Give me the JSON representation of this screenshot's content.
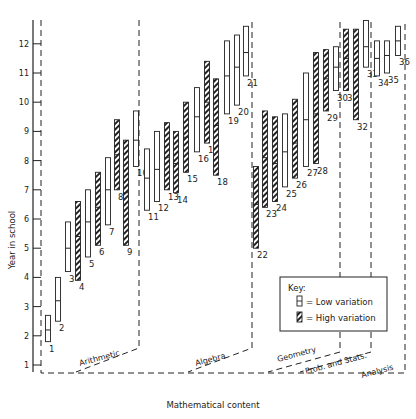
{
  "chart_data": {
    "type": "range-bar",
    "title": "",
    "xlabel": "Mathematical content",
    "ylabel": "Year in school",
    "ylim": [
      1,
      12.7
    ],
    "yticks": [
      1,
      2,
      3,
      4,
      5,
      6,
      7,
      8,
      9,
      10,
      11,
      12
    ],
    "grid": false,
    "regions": [
      {
        "name": "Arithmetic",
        "items": [
          1,
          2,
          3,
          4,
          5,
          6,
          7,
          8,
          9,
          10
        ]
      },
      {
        "name": "Algebra",
        "items": [
          11,
          12,
          13,
          14,
          15,
          16,
          17,
          18,
          19,
          20,
          21
        ]
      },
      {
        "name": "Geometry",
        "items": [
          22,
          23,
          24,
          25,
          26,
          27,
          28,
          29,
          30
        ]
      },
      {
        "name": "Prob. and Stats.",
        "items": [
          31,
          32,
          33
        ]
      },
      {
        "name": "Analysis",
        "items": [
          34,
          35,
          36
        ]
      }
    ],
    "legend": {
      "title": "Key:",
      "entries": [
        {
          "label": "= Low variation",
          "style": "open"
        },
        {
          "label": "= High variation",
          "style": "hatched"
        }
      ],
      "position": "lower right"
    },
    "series": [
      {
        "id": 1,
        "x": 48,
        "low": 1.8,
        "median": 2.2,
        "high": 2.7,
        "variation": "low"
      },
      {
        "id": 2,
        "x": 58,
        "low": 2.5,
        "median": 3.2,
        "high": 4.0,
        "variation": "low"
      },
      {
        "id": 3,
        "x": 68,
        "low": 4.2,
        "median": 5.0,
        "high": 5.9,
        "variation": "low"
      },
      {
        "id": 4,
        "x": 78,
        "low": 3.9,
        "median": 5.4,
        "high": 6.6,
        "variation": "high"
      },
      {
        "id": 5,
        "x": 88,
        "low": 4.7,
        "median": 5.9,
        "high": 7.0,
        "variation": "low"
      },
      {
        "id": 6,
        "x": 98,
        "low": 5.1,
        "median": 6.4,
        "high": 7.6,
        "variation": "high"
      },
      {
        "id": 7,
        "x": 108,
        "low": 5.8,
        "median": 7.0,
        "high": 8.1,
        "variation": "low"
      },
      {
        "id": 8,
        "x": 117,
        "low": 7.0,
        "median": 8.2,
        "high": 9.4,
        "variation": "high"
      },
      {
        "id": 9,
        "x": 126,
        "low": 5.1,
        "median": 6.9,
        "high": 8.7,
        "variation": "high"
      },
      {
        "id": 10,
        "x": 136,
        "low": 7.8,
        "median": 8.7,
        "high": 9.7,
        "variation": "low"
      },
      {
        "id": 11,
        "x": 147,
        "low": 6.3,
        "median": 7.4,
        "high": 8.4,
        "variation": "low"
      },
      {
        "id": 12,
        "x": 157,
        "low": 6.6,
        "median": 7.7,
        "high": 9.0,
        "variation": "low"
      },
      {
        "id": 13,
        "x": 167,
        "low": 7.0,
        "median": 8.1,
        "high": 9.3,
        "variation": "high"
      },
      {
        "id": 14,
        "x": 176,
        "low": 6.9,
        "median": 7.9,
        "high": 9.0,
        "variation": "high"
      },
      {
        "id": 15,
        "x": 186,
        "low": 7.6,
        "median": 8.8,
        "high": 10.0,
        "variation": "high"
      },
      {
        "id": 16,
        "x": 197,
        "low": 8.3,
        "median": 9.5,
        "high": 10.5,
        "variation": "low"
      },
      {
        "id": 17,
        "x": 207,
        "low": 8.6,
        "median": 10.0,
        "high": 11.4,
        "variation": "high"
      },
      {
        "id": 18,
        "x": 216,
        "low": 7.5,
        "median": 9.2,
        "high": 10.8,
        "variation": "high"
      },
      {
        "id": 19,
        "x": 227,
        "low": 9.6,
        "median": 10.9,
        "high": 12.1,
        "variation": "low"
      },
      {
        "id": 20,
        "x": 237,
        "low": 9.9,
        "median": 11.2,
        "high": 12.3,
        "variation": "low"
      },
      {
        "id": 21,
        "x": 246,
        "low": 10.9,
        "median": 11.7,
        "high": 12.6,
        "variation": "low"
      },
      {
        "id": 22,
        "x": 256,
        "low": 5.0,
        "median": 6.5,
        "high": 7.8,
        "variation": "high"
      },
      {
        "id": 23,
        "x": 265,
        "low": 6.4,
        "median": 8.1,
        "high": 9.7,
        "variation": "high"
      },
      {
        "id": 24,
        "x": 275,
        "low": 6.6,
        "median": 7.9,
        "high": 9.5,
        "variation": "high"
      },
      {
        "id": 25,
        "x": 285,
        "low": 7.1,
        "median": 8.3,
        "high": 9.6,
        "variation": "low"
      },
      {
        "id": 26,
        "x": 295,
        "low": 7.4,
        "median": 8.6,
        "high": 10.1,
        "variation": "high"
      },
      {
        "id": 27,
        "x": 306,
        "low": 7.8,
        "median": 9.4,
        "high": 11.0,
        "variation": "low"
      },
      {
        "id": 28,
        "x": 316,
        "low": 7.9,
        "median": 9.6,
        "high": 11.7,
        "variation": "high"
      },
      {
        "id": 29,
        "x": 326,
        "low": 9.7,
        "median": 10.8,
        "high": 11.8,
        "variation": "high"
      },
      {
        "id": 30,
        "x": 336,
        "low": 10.4,
        "median": 11.2,
        "high": 11.9,
        "variation": "low"
      },
      {
        "id": 31,
        "x": 346,
        "low": 10.4,
        "median": 11.5,
        "high": 12.5,
        "variation": "high"
      },
      {
        "id": 32,
        "x": 356,
        "low": 9.4,
        "median": 11.1,
        "high": 12.5,
        "variation": "high"
      },
      {
        "id": 33,
        "x": 366,
        "low": 11.2,
        "median": 11.9,
        "high": 12.8,
        "variation": "low"
      },
      {
        "id": 34,
        "x": 377,
        "low": 10.9,
        "median": 11.5,
        "high": 12.1,
        "variation": "low"
      },
      {
        "id": 35,
        "x": 387,
        "low": 11.0,
        "median": 11.6,
        "high": 12.1,
        "variation": "low"
      },
      {
        "id": 36,
        "x": 398,
        "low": 11.6,
        "median": 12.1,
        "high": 12.6,
        "variation": "low"
      }
    ]
  }
}
